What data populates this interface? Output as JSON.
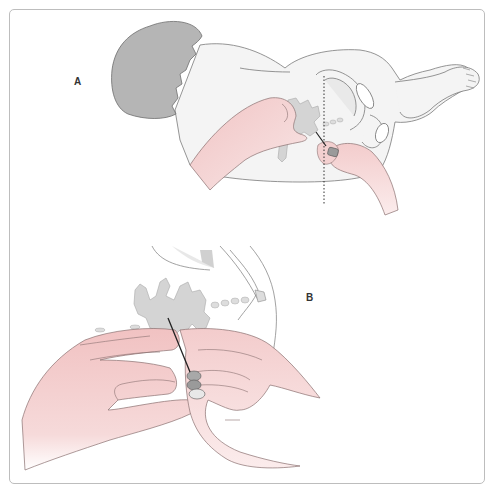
{
  "figure": {
    "panels": [
      {
        "label": "A",
        "description": "infant positioned lateral decubitus; clinician hand palpates spine; needle inserted along dashed iliac crest line"
      },
      {
        "label": "B",
        "description": "close-up of both hands guiding spinal needle between lumbar vertebrae"
      }
    ],
    "colors": {
      "frame": "#bdbdbd",
      "outline": "#6e6e6e",
      "skin_fill": "#f2f2f2",
      "hair": "#b5b5b5",
      "hand": "#f3cfcf",
      "vertebra": "#d6d6d6",
      "needle": "#222222"
    }
  }
}
